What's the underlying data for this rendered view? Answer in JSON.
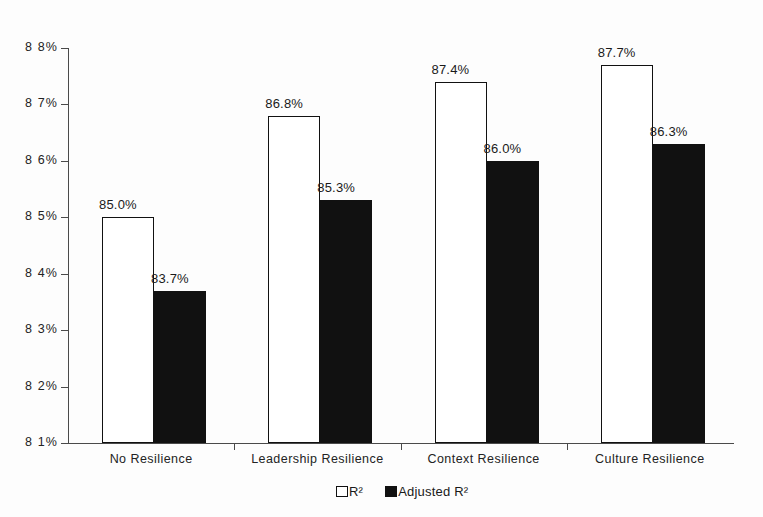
{
  "chart_data": {
    "type": "bar",
    "title": "",
    "subtitle": "",
    "xlabel": "",
    "ylabel": "",
    "categories": [
      "No Resilience",
      "Leadership Resilience",
      "Context Resilience",
      "Culture Resilience"
    ],
    "series": [
      {
        "name": "R²",
        "color": "#ffffff",
        "edge_color": "#111111",
        "values": [
          85.0,
          86.8,
          87.4,
          87.7
        ],
        "labels": [
          "85.0%",
          "86.8%",
          "87.4%",
          "87.7%"
        ]
      },
      {
        "name": "Adjusted R²",
        "color": "#111111",
        "edge_color": "#111111",
        "values": [
          83.7,
          85.3,
          86.0,
          86.3
        ],
        "labels": [
          "83.7%",
          "85.3%",
          "86.0%",
          "86.3%"
        ]
      }
    ],
    "ylim": [
      81,
      88
    ],
    "ytick_values": [
      81,
      82,
      83,
      84,
      85,
      86,
      87,
      88
    ],
    "ytick_labels": [
      "8 1%",
      "8 2%",
      "8 3%",
      "8 4%",
      "8 5%",
      "8 6%",
      "8 7%",
      "8 8%"
    ],
    "grid": false,
    "legend_position": "bottom-center",
    "value_labels_shown": true,
    "units": "percent"
  },
  "legend": {
    "items": [
      {
        "label": "R²",
        "swatch": "light"
      },
      {
        "label": "Adjusted R²",
        "swatch": "dark"
      }
    ]
  },
  "colors": {
    "background": "#fdfdfd",
    "axis": "#4a4a4a",
    "text": "#232323",
    "series_light": "#ffffff",
    "series_dark": "#111111"
  }
}
